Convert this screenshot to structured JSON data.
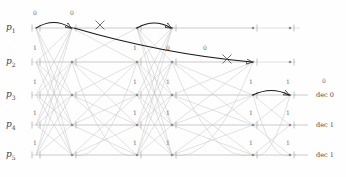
{
  "figure": {
    "type": "trellis-diagram",
    "title": "",
    "background": "#ffffff",
    "edge_color": "#b9b9b9",
    "node_color": "#8a8a8a",
    "survivor_color": "#1a1a1a",
    "label_color": "#4a4a4a"
  },
  "rows": [
    {
      "id": "p1",
      "label": "p",
      "sub": "1",
      "y": 28
    },
    {
      "id": "p2",
      "label": "p",
      "sub": "2",
      "y": 62
    },
    {
      "id": "p3",
      "label": "p",
      "sub": "3",
      "y": 95
    },
    {
      "id": "p4",
      "label": "p",
      "sub": "4",
      "y": 125
    },
    {
      "id": "p5",
      "label": "p",
      "sub": "5",
      "y": 155
    }
  ],
  "columns": [
    {
      "index": 0,
      "x": 36
    },
    {
      "index": 1,
      "x": 72
    },
    {
      "index": 2,
      "x": 137
    },
    {
      "index": 3,
      "x": 172
    },
    {
      "index": 4,
      "x": 253
    },
    {
      "index": 5,
      "x": 290
    }
  ],
  "bit_labels": [
    {
      "text": "0",
      "x": 33,
      "y": 10
    },
    {
      "text": "0",
      "x": 70,
      "y": 10
    },
    {
      "text": "1",
      "x": 33,
      "y": 45
    },
    {
      "text": "1",
      "x": 133,
      "y": 45
    },
    {
      "text": "0",
      "x": 166,
      "y": 45
    },
    {
      "text": "0",
      "x": 203,
      "y": 45
    },
    {
      "text": "0",
      "x": 322,
      "y": 78
    },
    {
      "text": "1",
      "x": 33,
      "y": 79
    },
    {
      "text": "1",
      "x": 133,
      "y": 79
    },
    {
      "text": "1",
      "x": 166,
      "y": 79
    },
    {
      "text": "1",
      "x": 249,
      "y": 79
    },
    {
      "text": "1",
      "x": 286,
      "y": 79
    },
    {
      "text": "1",
      "x": 33,
      "y": 110
    },
    {
      "text": "1",
      "x": 133,
      "y": 110
    },
    {
      "text": "1",
      "x": 166,
      "y": 110
    },
    {
      "text": "1",
      "x": 249,
      "y": 110
    },
    {
      "text": "1",
      "x": 286,
      "y": 110
    },
    {
      "text": "1",
      "x": 33,
      "y": 140
    },
    {
      "text": "1",
      "x": 133,
      "y": 140
    },
    {
      "text": "1",
      "x": 166,
      "y": 140
    },
    {
      "text": "1",
      "x": 249,
      "y": 140
    },
    {
      "text": "1",
      "x": 286,
      "y": 140
    }
  ],
  "decisions": [
    {
      "text": "dec 0",
      "x": 316,
      "y": 92
    },
    {
      "text": "dec 1",
      "x": 316,
      "y": 122
    },
    {
      "text": "dec 1",
      "x": 316,
      "y": 152
    }
  ],
  "eliminated_marks": [
    {
      "name": "x-mark-1",
      "x": 100,
      "y": 25
    },
    {
      "name": "x-mark-2",
      "x": 227,
      "y": 59
    }
  ],
  "survivor_path": {
    "description": "bold traced path across the trellis",
    "segments": [
      {
        "from_col": 0,
        "from_row": "p1",
        "to_col": 1,
        "to_row": "p1"
      },
      {
        "from_col": 1,
        "from_row": "p1",
        "to_col": 4,
        "to_row": "p2"
      },
      {
        "from_col": 2,
        "from_row": "p1",
        "to_col": 3,
        "to_row": "p1"
      },
      {
        "from_col": 4,
        "from_row": "p2",
        "to_col": 5,
        "to_row": "p3"
      }
    ]
  }
}
